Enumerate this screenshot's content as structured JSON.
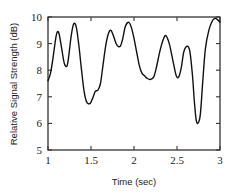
{
  "chart_data": {
    "type": "line",
    "title": "",
    "xlabel": "Time (sec)",
    "ylabel": "Relative Signal Strength (dB)",
    "xlim": [
      1,
      3
    ],
    "ylim": [
      5,
      10
    ],
    "grid": false,
    "legend": null,
    "xticks": [
      1,
      1.5,
      2,
      2.5,
      3
    ],
    "xtick_labels": [
      "1",
      "1.5",
      "2",
      "2.5",
      "3"
    ],
    "yticks": [
      5,
      6,
      7,
      8,
      9,
      10
    ],
    "ytick_labels": [
      "5",
      "6",
      "7",
      "8",
      "9",
      "10"
    ],
    "series": [
      {
        "name": "signal",
        "color": "#111111",
        "x": [
          1.0,
          1.03,
          1.06,
          1.09,
          1.11,
          1.13,
          1.16,
          1.19,
          1.22,
          1.24,
          1.27,
          1.3,
          1.33,
          1.36,
          1.39,
          1.42,
          1.45,
          1.49,
          1.52,
          1.55,
          1.58,
          1.61,
          1.64,
          1.67,
          1.7,
          1.73,
          1.76,
          1.8,
          1.84,
          1.87,
          1.9,
          1.94,
          1.97,
          2.0,
          2.03,
          2.06,
          2.09,
          2.12,
          2.15,
          2.19,
          2.23,
          2.26,
          2.3,
          2.34,
          2.37,
          2.41,
          2.45,
          2.49,
          2.52,
          2.55,
          2.58,
          2.62,
          2.65,
          2.68,
          2.7,
          2.72,
          2.74,
          2.77,
          2.8,
          2.83,
          2.87,
          2.91,
          2.94,
          2.97,
          3.0
        ],
        "y": [
          7.6,
          7.9,
          8.5,
          9.2,
          9.45,
          9.35,
          8.8,
          8.25,
          8.15,
          8.5,
          9.3,
          9.75,
          9.6,
          8.9,
          8.0,
          7.2,
          6.8,
          6.75,
          6.95,
          7.2,
          7.25,
          7.5,
          8.2,
          8.9,
          9.35,
          9.5,
          9.3,
          8.95,
          8.9,
          9.2,
          9.65,
          9.8,
          9.6,
          9.2,
          8.7,
          8.2,
          7.9,
          7.8,
          7.7,
          7.65,
          7.75,
          8.1,
          8.7,
          9.15,
          9.3,
          9.0,
          8.4,
          7.8,
          7.75,
          8.1,
          8.7,
          8.9,
          8.7,
          7.8,
          6.9,
          6.2,
          6.0,
          6.3,
          7.6,
          8.8,
          9.5,
          9.85,
          9.95,
          9.9,
          9.8
        ]
      }
    ]
  },
  "layout": {
    "plot": {
      "left": 48,
      "top": 17,
      "right": 220,
      "bottom": 150
    }
  }
}
